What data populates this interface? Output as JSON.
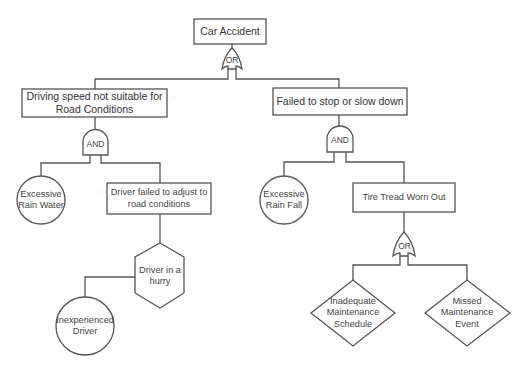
{
  "diagram": {
    "type": "fault-tree",
    "top_event": {
      "id": "car-accident",
      "label": "Car Accident",
      "shape": "rectangle"
    },
    "gates": [
      {
        "id": "gate-top",
        "type": "OR",
        "label": "OR"
      },
      {
        "id": "gate-left",
        "type": "AND",
        "label": "AND"
      },
      {
        "id": "gate-right",
        "type": "AND",
        "label": "AND"
      },
      {
        "id": "gate-tire",
        "type": "OR",
        "label": "OR"
      }
    ],
    "events": {
      "driving_speed": {
        "label": "Driving speed not suitable for\nRoad Conditions",
        "shape": "rectangle"
      },
      "failed_stop": {
        "label": "Failed to stop or slow down",
        "shape": "rectangle"
      },
      "rain_water": {
        "label": "Excessive\nRain Water",
        "shape": "circle"
      },
      "driver_failed_adjust": {
        "label": "Driver failed to adjust to\nroad conditions",
        "shape": "rectangle"
      },
      "driver_hurry": {
        "label": "Driver in a\nhurry",
        "shape": "hexagon"
      },
      "inexperienced_driver": {
        "label": "Inexperienced\nDriver",
        "shape": "circle"
      },
      "rain_fall": {
        "label": "Excessive\nRain Fall",
        "shape": "circle"
      },
      "tire_tread": {
        "label": "Tire Tread Worn Out",
        "shape": "rectangle"
      },
      "inadequate_schedule": {
        "label": "Inadequate\nMaintenance\nSchedule",
        "shape": "diamond"
      },
      "missed_event": {
        "label": "Missed\nMaintenance\nEvent",
        "shape": "diamond"
      }
    },
    "edges": [
      [
        "car-accident",
        "gate-top"
      ],
      [
        "gate-top",
        "driving_speed"
      ],
      [
        "gate-top",
        "failed_stop"
      ],
      [
        "driving_speed",
        "gate-left"
      ],
      [
        "gate-left",
        "rain_water"
      ],
      [
        "gate-left",
        "driver_failed_adjust"
      ],
      [
        "driver_failed_adjust",
        "driver_hurry"
      ],
      [
        "driver_hurry",
        "inexperienced_driver"
      ],
      [
        "failed_stop",
        "gate-right"
      ],
      [
        "gate-right",
        "rain_fall"
      ],
      [
        "gate-right",
        "tire_tread"
      ],
      [
        "tire_tread",
        "gate-tire"
      ],
      [
        "gate-tire",
        "inadequate_schedule"
      ],
      [
        "gate-tire",
        "missed_event"
      ]
    ],
    "colors": {
      "line": "#555555",
      "text": "#333333",
      "background": "#ffffff"
    }
  }
}
